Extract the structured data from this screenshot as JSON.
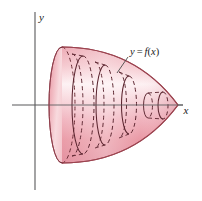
{
  "figure": {
    "kind": "solid-of-revolution-shell-method",
    "background_color": "#ffffff",
    "axes": {
      "x_axis_label": "x",
      "y_axis_label": "y",
      "axis_color": "#58585a",
      "x_axis_y_px": 105,
      "y_axis_x_px": 35,
      "x_axis_from_px": 12,
      "x_axis_to_px": 183,
      "y_axis_from_px": 12,
      "y_axis_to_px": 190
    },
    "curve_label": {
      "text_lhs": "y",
      "text_eq": "=",
      "text_fn": "f",
      "text_paren_open": "(",
      "text_var": "x",
      "text_paren_close": ")",
      "full_text": "y = f(x)",
      "x_px": 130,
      "y_px": 52,
      "leader_from_px": [
        128,
        57
      ],
      "leader_to_px": [
        118,
        72
      ]
    },
    "solid": {
      "description": "Paraboloid-like solid of revolution about the x-axis, opening left, apex at right",
      "fill_light": "#fbe9ec",
      "fill_mid": "#f0aab4",
      "fill_deep": "#dd8090",
      "outline_color": "#9c4450",
      "apex_x_px": 178,
      "base_x_px": 62,
      "base_half_height_px": 58,
      "base_ellipse_rx_px": 13
    },
    "shells": [
      {
        "name": "shell-1",
        "x_px": 62,
        "ry_px": 58,
        "rx_px": 13
      },
      {
        "name": "shell-2",
        "x_px": 83,
        "ry_px": 49,
        "rx_px": 11
      },
      {
        "name": "shell-3",
        "x_px": 105,
        "ry_px": 40,
        "rx_px": 9
      },
      {
        "name": "shell-4",
        "x_px": 127,
        "ry_px": 29,
        "rx_px": 7
      },
      {
        "name": "shell-5",
        "x_px": 155,
        "ry_px": 14,
        "rx_px": 5
      }
    ],
    "stroke_styles": {
      "solid_front_arc": "solid",
      "hidden_back_arc": "dashed",
      "dash_pattern": "4 3"
    }
  }
}
